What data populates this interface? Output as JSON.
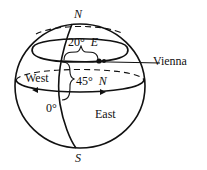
{
  "diagram": {
    "labels": {
      "north": "N",
      "south": "S",
      "longitude_value": "20°",
      "longitude_dir": "E",
      "latitude_value": "45°",
      "latitude_dir": "N",
      "prime_meridian": "0°",
      "west": "West",
      "east": "East",
      "city": "Vienna"
    },
    "colors": {
      "line": "#111111",
      "background": "#ffffff"
    }
  }
}
